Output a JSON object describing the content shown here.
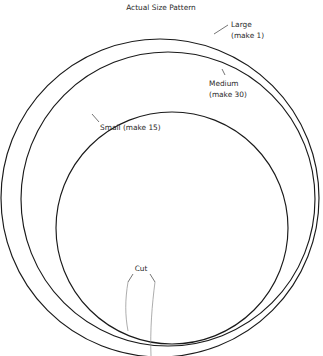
{
  "page": {
    "background_color": "#ffffff",
    "width": 323,
    "height": 356
  },
  "body_text": {
    "lines": [
      "t the",
      "g de-",
      "s on"
    ],
    "note": "clipped serif body text at left margin"
  },
  "figure": {
    "title": "Actual Size Pattern",
    "stroke_color": "#1a1a1a",
    "leader_color": "#3a3a3a",
    "cut_color": "#8a8a8a",
    "circles": [
      {
        "id": "large",
        "label_line1": "Large",
        "label_line2": "(make 1)",
        "cx": 158,
        "cy": 196,
        "r": 157
      },
      {
        "id": "medium",
        "label_line1": "Medium",
        "label_line2": "(make 30)",
        "cx": 158,
        "cy": 199,
        "r": 153
      },
      {
        "id": "small",
        "label_line1": "Small (make 15)",
        "label_line2": "",
        "cx": 172,
        "cy": 228,
        "r": 100
      }
    ],
    "cut": {
      "label": "Cut"
    }
  }
}
